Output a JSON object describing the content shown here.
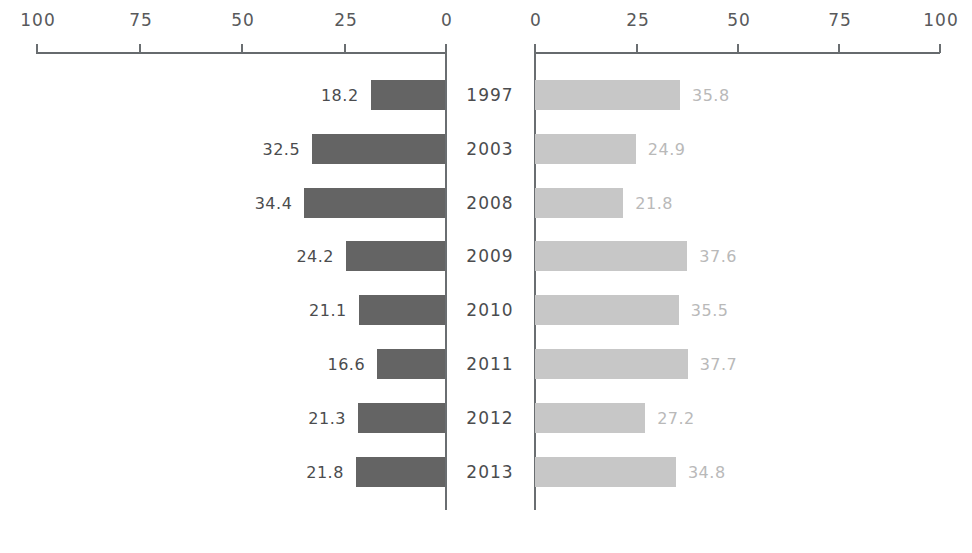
{
  "chart_data": {
    "type": "bar",
    "subtype": "tornado-diverging-horizontal-bar",
    "title": "",
    "xlabel": "",
    "ylabel": "",
    "categories": [
      "1997",
      "2003",
      "2008",
      "2009",
      "2010",
      "2011",
      "2012",
      "2013"
    ],
    "series": [
      {
        "name": "left",
        "values": [
          18.2,
          32.5,
          34.4,
          24.2,
          21.1,
          16.6,
          21.3,
          21.8
        ],
        "labels": [
          "18.2",
          "32.5",
          "34.4",
          "24.2",
          "21.1",
          "16.6",
          "21.3",
          "21.8"
        ],
        "color": "#646464",
        "direction": "left"
      },
      {
        "name": "right",
        "values": [
          35.8,
          24.9,
          21.8,
          37.6,
          35.5,
          37.7,
          27.2,
          34.8
        ],
        "labels": [
          "35.8",
          "24.9",
          "21.8",
          "37.6",
          "35.5",
          "37.7",
          "27.2",
          "34.8"
        ],
        "color": "#c7c7c7",
        "direction": "right"
      }
    ],
    "axes": {
      "left": {
        "ticks": [
          100,
          75,
          50,
          25,
          0
        ],
        "tick_labels": [
          "100",
          "75",
          "50",
          "25",
          "0"
        ],
        "range": [
          0,
          100
        ],
        "reversed": true,
        "position": "top"
      },
      "right": {
        "ticks": [
          0,
          25,
          50,
          75,
          100
        ],
        "tick_labels": [
          "0",
          "25",
          "50",
          "75",
          "100"
        ],
        "range": [
          0,
          100
        ],
        "reversed": false,
        "position": "top"
      }
    },
    "grid": false,
    "legend": null,
    "colors": {
      "left_bar": "#646464",
      "right_bar": "#c7c7c7",
      "axis": "#6a6e71",
      "left_value_text": "#4b4c4e",
      "right_value_text": "#b9b9b9",
      "category_text": "#4b4c4e",
      "background": "#ffffff"
    }
  }
}
